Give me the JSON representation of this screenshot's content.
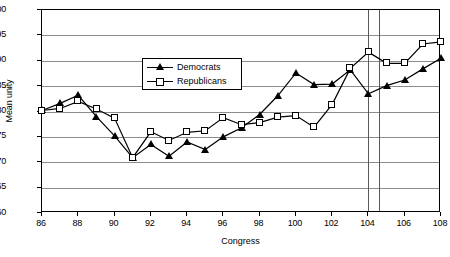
{
  "chart_data": {
    "type": "line",
    "title": "",
    "xlabel": "Congress",
    "ylabel": "Mean unity",
    "xlim": [
      86,
      108
    ],
    "ylim": [
      60,
      100
    ],
    "ytick_step": 5,
    "xtick_step": 2,
    "grid": true,
    "legend_position": "top-left-inside",
    "x": [
      86,
      87,
      88,
      89,
      90,
      91,
      92,
      93,
      94,
      95,
      96,
      97,
      98,
      99,
      100,
      101,
      102,
      103,
      104,
      105,
      106,
      107,
      108
    ],
    "xtick_labels": [
      "86",
      "88",
      "90",
      "92",
      "94",
      "96",
      "98",
      "100",
      "102",
      "104",
      "106",
      "108"
    ],
    "ytick_labels": [
      "60",
      "65",
      "70",
      "75",
      "80",
      "85",
      "90",
      "95",
      "100"
    ],
    "series": [
      {
        "name": "Democrats",
        "marker": "filled-triangle",
        "values": [
          80.2,
          81.6,
          83.2,
          79.0,
          75.2,
          70.9,
          73.5,
          71.2,
          74.0,
          72.5,
          75.0,
          76.8,
          79.4,
          83.1,
          87.6,
          85.3,
          85.4,
          88.2,
          83.5,
          85.1,
          86.2,
          88.4,
          90.5
        ]
      },
      {
        "name": "Republicans",
        "marker": "open-square",
        "values": [
          80.2,
          80.6,
          82.0,
          80.5,
          78.7,
          70.9,
          76.0,
          74.3,
          75.9,
          76.2,
          78.8,
          77.4,
          77.8,
          78.9,
          79.2,
          76.9,
          81.4,
          88.5,
          91.7,
          89.5,
          89.5,
          93.3,
          93.7
        ]
      }
    ],
    "reference_lines": [
      {
        "name": "vline-104",
        "x": 104
      },
      {
        "name": "vline-104-5",
        "x": 104.6
      }
    ]
  },
  "legend": {
    "items": [
      {
        "label": "Democrats"
      },
      {
        "label": "Republicans"
      }
    ]
  }
}
